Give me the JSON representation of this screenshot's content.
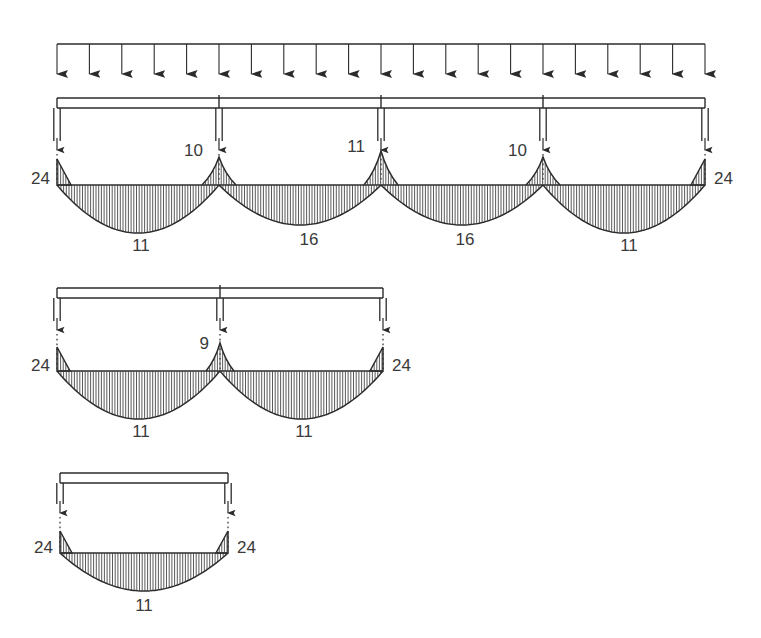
{
  "figure": {
    "type": "bending-moment-diagram",
    "background_color": "#ffffff",
    "line_color": "#2b2b2b",
    "label_color": "#3a3a3a",
    "hatch_color": "#3c3c3c"
  },
  "load": {
    "name": "uniformly-distributed-load",
    "arrow_count": 21,
    "x_start": 57,
    "x_end": 705,
    "line_y": 44,
    "arrow_tip_y": 75
  },
  "beams": [
    {
      "id": "beam-4span",
      "name": "four-span-continuous-beam",
      "beam_y_top": 98,
      "beam_y_bottom": 108,
      "x_start": 57,
      "x_end": 705,
      "column_bottom_y": 150,
      "baseline_y": 185,
      "supports": [
        57,
        219,
        381,
        543,
        705
      ],
      "interior_break_x": [
        219,
        381,
        543
      ],
      "spans": [
        {
          "x0": 57,
          "x1": 219,
          "sag_depth": 48,
          "label": "11",
          "label_x": 141,
          "label_y": 247
        },
        {
          "x0": 219,
          "x1": 381,
          "sag_depth": 40,
          "label": "16",
          "label_x": 309,
          "label_y": 241
        },
        {
          "x0": 381,
          "x1": 543,
          "sag_depth": 40,
          "label": "16",
          "label_x": 465,
          "label_y": 241
        },
        {
          "x0": 543,
          "x1": 705,
          "sag_depth": 48,
          "label": "11",
          "label_x": 629,
          "label_y": 247
        }
      ],
      "hog_peaks": [
        {
          "x": 219,
          "height": 28,
          "half_width": 17,
          "label": "10",
          "label_x": 203,
          "label_y": 152,
          "anchor": "end"
        },
        {
          "x": 381,
          "height": 34,
          "half_width": 17,
          "label": "11",
          "label_x": 365,
          "label_y": 148,
          "anchor": "end"
        },
        {
          "x": 543,
          "height": 28,
          "half_width": 17,
          "label": "10",
          "label_x": 527,
          "label_y": 152,
          "anchor": "end"
        }
      ],
      "end_wedges": [
        {
          "x": 57,
          "side": "right",
          "height": 26,
          "width": 14,
          "label": "24",
          "label_x": 50,
          "label_y": 180,
          "anchor": "end"
        },
        {
          "x": 705,
          "side": "left",
          "height": 26,
          "width": 14,
          "label": "24",
          "label_x": 714,
          "label_y": 180,
          "anchor": "start"
        }
      ]
    },
    {
      "id": "beam-2span",
      "name": "two-span-continuous-beam",
      "beam_y_top": 288,
      "beam_y_bottom": 298,
      "x_start": 57,
      "x_end": 383,
      "column_bottom_y": 330,
      "baseline_y": 371,
      "supports": [
        57,
        220,
        383
      ],
      "interior_break_x": [
        220
      ],
      "spans": [
        {
          "x0": 57,
          "x1": 220,
          "sag_depth": 48,
          "label": "11",
          "label_x": 141,
          "label_y": 433
        },
        {
          "x0": 220,
          "x1": 383,
          "sag_depth": 48,
          "label": "11",
          "label_x": 304,
          "label_y": 433
        }
      ],
      "hog_peaks": [
        {
          "x": 220,
          "height": 28,
          "half_width": 14,
          "label": "9",
          "label_x": 209,
          "label_y": 345,
          "anchor": "end"
        }
      ],
      "end_wedges": [
        {
          "x": 57,
          "side": "right",
          "height": 24,
          "width": 13,
          "label": "24",
          "label_x": 50,
          "label_y": 367,
          "anchor": "end"
        },
        {
          "x": 383,
          "side": "left",
          "height": 24,
          "width": 13,
          "label": "24",
          "label_x": 392,
          "label_y": 367,
          "anchor": "start"
        }
      ]
    },
    {
      "id": "beam-1span",
      "name": "single-span-beam",
      "beam_y_top": 473,
      "beam_y_bottom": 483,
      "x_start": 60,
      "x_end": 228,
      "column_bottom_y": 513,
      "baseline_y": 553,
      "supports": [
        60,
        228
      ],
      "interior_break_x": [],
      "spans": [
        {
          "x0": 60,
          "x1": 228,
          "sag_depth": 38,
          "label": "11",
          "label_x": 144,
          "label_y": 607
        }
      ],
      "hog_peaks": [],
      "end_wedges": [
        {
          "x": 60,
          "side": "right",
          "height": 22,
          "width": 12,
          "label": "24",
          "label_x": 53,
          "label_y": 549,
          "anchor": "end"
        },
        {
          "x": 228,
          "side": "left",
          "height": 22,
          "width": 12,
          "label": "24",
          "label_x": 237,
          "label_y": 549,
          "anchor": "start"
        }
      ]
    }
  ]
}
